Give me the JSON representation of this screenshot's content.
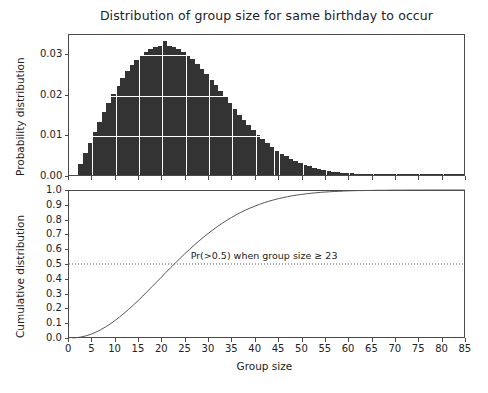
{
  "chart_data": [
    {
      "type": "bar",
      "title": "Distribution of group size for same birthday to occur",
      "xlabel": "",
      "ylabel": "Probability distribution",
      "xlim": [
        0,
        85
      ],
      "ylim": [
        0,
        0.035
      ],
      "grid": true,
      "xticklabels": [],
      "yticklabels": [
        "0.00",
        "0.01",
        "0.02",
        "0.03"
      ],
      "ytickvalues": [
        0.0,
        0.01,
        0.02,
        0.03
      ],
      "xtickvalues": [
        0,
        5,
        10,
        15,
        20,
        25,
        30,
        35,
        40,
        45,
        50,
        55,
        60,
        65,
        70,
        75,
        80,
        85
      ],
      "bar_color": "#333333",
      "categories": [
        1,
        2,
        3,
        4,
        5,
        6,
        7,
        8,
        9,
        10,
        11,
        12,
        13,
        14,
        15,
        16,
        17,
        18,
        19,
        20,
        21,
        22,
        23,
        24,
        25,
        26,
        27,
        28,
        29,
        30,
        31,
        32,
        33,
        34,
        35,
        36,
        37,
        38,
        39,
        40,
        41,
        42,
        43,
        44,
        45,
        46,
        47,
        48,
        49,
        50,
        51,
        52,
        53,
        54,
        55,
        56,
        57,
        58,
        59,
        60,
        61,
        62,
        63,
        64,
        65,
        66,
        67,
        68,
        69,
        70,
        71,
        72,
        73,
        74,
        75,
        76,
        77,
        78,
        79,
        80,
        81,
        82,
        83,
        84,
        85
      ],
      "values": [
        0.0,
        0.0027,
        0.0054,
        0.008,
        0.0106,
        0.0131,
        0.0155,
        0.0178,
        0.02,
        0.022,
        0.0239,
        0.0256,
        0.0271,
        0.0284,
        0.0295,
        0.0304,
        0.0311,
        0.0316,
        0.0319,
        0.033,
        0.0318,
        0.0315,
        0.031,
        0.0303,
        0.0295,
        0.0285,
        0.0274,
        0.0262,
        0.0249,
        0.0235,
        0.0221,
        0.0207,
        0.0192,
        0.0178,
        0.0163,
        0.0149,
        0.0136,
        0.0123,
        0.011,
        0.0099,
        0.0088,
        0.0078,
        0.0069,
        0.006,
        0.0053,
        0.0046,
        0.0039,
        0.0034,
        0.0029,
        0.0025,
        0.0021,
        0.0018,
        0.0015,
        0.0012,
        0.001,
        0.0008,
        0.0007,
        0.0006,
        0.0005,
        0.0004,
        0.0003,
        0.00025,
        0.0002,
        0.00016,
        0.00013,
        0.0001,
        8e-05,
        6e-05,
        5e-05,
        4e-05,
        3e-05,
        2.5e-05,
        2e-05,
        1.5e-05,
        1e-05,
        8e-06,
        6e-06,
        5e-06,
        4e-06,
        3e-06,
        2e-06,
        1.5e-06,
        1e-06,
        8e-07,
        5e-07
      ]
    },
    {
      "type": "line",
      "title": "",
      "xlabel": "Group size",
      "ylabel": "Cumulative distribution",
      "xlim": [
        0,
        85
      ],
      "ylim": [
        0,
        1.0
      ],
      "grid": false,
      "line_color": "#555555",
      "xticklabels": [
        "0",
        "5",
        "10",
        "15",
        "20",
        "25",
        "30",
        "35",
        "40",
        "45",
        "50",
        "55",
        "60",
        "65",
        "70",
        "75",
        "80",
        "85"
      ],
      "xtickvalues": [
        0,
        5,
        10,
        15,
        20,
        25,
        30,
        35,
        40,
        45,
        50,
        55,
        60,
        65,
        70,
        75,
        80,
        85
      ],
      "yticklabels": [
        "0.0",
        "0.1",
        "0.2",
        "0.3",
        "0.4",
        "0.5",
        "0.6",
        "0.7",
        "0.8",
        "0.9",
        "1.0"
      ],
      "ytickvalues": [
        0.0,
        0.1,
        0.2,
        0.3,
        0.4,
        0.5,
        0.6,
        0.7,
        0.8,
        0.9,
        1.0
      ],
      "x": [
        1,
        2,
        3,
        4,
        5,
        6,
        7,
        8,
        9,
        10,
        11,
        12,
        13,
        14,
        15,
        16,
        17,
        18,
        19,
        20,
        21,
        22,
        23,
        24,
        25,
        26,
        27,
        28,
        29,
        30,
        31,
        32,
        33,
        34,
        35,
        36,
        37,
        38,
        39,
        40,
        41,
        42,
        43,
        44,
        45,
        46,
        47,
        48,
        49,
        50,
        51,
        52,
        53,
        54,
        55,
        56,
        57,
        58,
        59,
        60,
        61,
        62,
        63,
        64,
        65,
        66,
        67,
        68,
        69,
        70,
        71,
        72,
        73,
        74,
        75,
        76,
        77,
        78,
        79,
        80,
        81,
        82,
        83,
        84,
        85
      ],
      "y": [
        0.0,
        0.003,
        0.008,
        0.016,
        0.027,
        0.04,
        0.056,
        0.074,
        0.094,
        0.117,
        0.141,
        0.167,
        0.194,
        0.223,
        0.252,
        0.283,
        0.315,
        0.347,
        0.379,
        0.411,
        0.444,
        0.476,
        0.507,
        0.538,
        0.569,
        0.598,
        0.627,
        0.654,
        0.681,
        0.706,
        0.73,
        0.753,
        0.775,
        0.795,
        0.814,
        0.832,
        0.849,
        0.864,
        0.878,
        0.891,
        0.903,
        0.914,
        0.924,
        0.933,
        0.941,
        0.948,
        0.955,
        0.961,
        0.966,
        0.97,
        0.974,
        0.978,
        0.981,
        0.984,
        0.986,
        0.988,
        0.99,
        0.991,
        0.993,
        0.994,
        0.995,
        0.996,
        0.996,
        0.997,
        0.997,
        0.998,
        0.998,
        0.998,
        0.999,
        0.999,
        0.999,
        0.999,
        0.9995,
        0.9996,
        0.9997,
        0.9997,
        0.9998,
        0.9998,
        0.9999,
        0.9999,
        0.9999,
        0.99995,
        0.99996,
        0.99997,
        0.99998
      ],
      "annotations": [
        {
          "text": "Pr(>0.5) when group size ≥ 23",
          "x": 42,
          "y": 0.56
        },
        {
          "text": "threshold-line",
          "type": "hline",
          "y": 0.5,
          "style": "dotted"
        }
      ]
    }
  ],
  "top_panel": {
    "title": "Distribution of group size for same birthday to occur",
    "ylabel": "Probability distribution"
  },
  "bottom_panel": {
    "ylabel": "Cumulative distribution",
    "xlabel": "Group size",
    "annotation": "Pr(>0.5) when group size ≥ 23"
  }
}
